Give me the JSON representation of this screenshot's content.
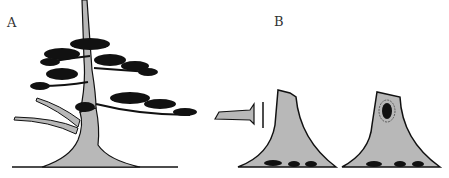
{
  "figure": {
    "panels": [
      {
        "label": "A",
        "subject": "bonsai tree with jin branches"
      },
      {
        "label": "B",
        "subject": "trunk stump cut sequence"
      }
    ],
    "colors": {
      "trunk_fill": "#b8b8b8",
      "ink": "#111111",
      "background": "#ffffff"
    }
  }
}
